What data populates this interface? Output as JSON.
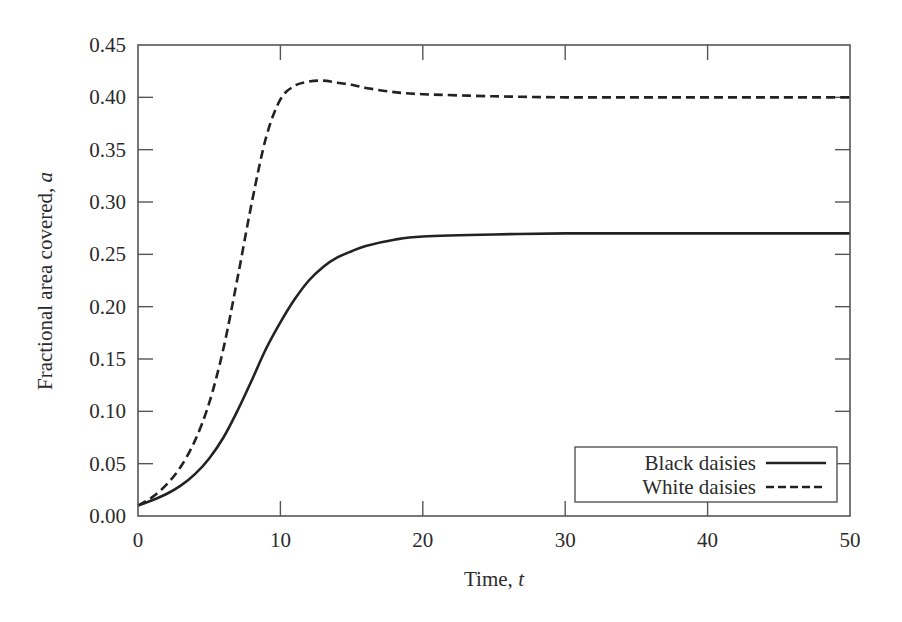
{
  "chart_data": {
    "type": "line",
    "title": "",
    "xlabel": "Time, t",
    "xlabel_main": "Time, ",
    "xlabel_var": "t",
    "ylabel": "Fractional area covered, a",
    "ylabel_main": "Fractional area covered, ",
    "ylabel_var": "a",
    "xlim": [
      0,
      50
    ],
    "ylim": [
      0,
      0.45
    ],
    "grid": false,
    "legend_position": "lower right",
    "x_ticks": [
      0,
      10,
      20,
      30,
      40,
      50
    ],
    "x_tick_labels": [
      "0",
      "10",
      "20",
      "30",
      "40",
      "50"
    ],
    "y_ticks": [
      0,
      0.05,
      0.1,
      0.15,
      0.2,
      0.25,
      0.3,
      0.35,
      0.4,
      0.45
    ],
    "y_tick_labels": [
      "0.00",
      "0.05",
      "0.10",
      "0.15",
      "0.20",
      "0.25",
      "0.30",
      "0.35",
      "0.40",
      "0.45"
    ],
    "series": [
      {
        "name": "Black daisies",
        "style": "solid",
        "color": "#222222",
        "x": [
          0,
          1,
          2,
          3,
          4,
          5,
          6,
          7,
          8,
          9,
          10,
          11,
          12,
          13,
          14,
          15,
          16,
          18,
          20,
          25,
          30,
          35,
          40,
          45,
          50
        ],
        "values": [
          0.01,
          0.015,
          0.021,
          0.029,
          0.04,
          0.055,
          0.075,
          0.101,
          0.13,
          0.16,
          0.185,
          0.207,
          0.225,
          0.238,
          0.247,
          0.253,
          0.258,
          0.264,
          0.267,
          0.269,
          0.27,
          0.27,
          0.27,
          0.27,
          0.27
        ]
      },
      {
        "name": "White daisies",
        "style": "dashed",
        "color": "#222222",
        "x": [
          0,
          1,
          2,
          3,
          4,
          5,
          6,
          7,
          8,
          9,
          10,
          11,
          12,
          13,
          14,
          15,
          16,
          18,
          20,
          25,
          30,
          35,
          40,
          45,
          50
        ],
        "values": [
          0.01,
          0.018,
          0.03,
          0.047,
          0.072,
          0.108,
          0.16,
          0.228,
          0.3,
          0.362,
          0.398,
          0.411,
          0.415,
          0.416,
          0.414,
          0.412,
          0.409,
          0.405,
          0.403,
          0.401,
          0.4,
          0.4,
          0.4,
          0.4,
          0.4
        ]
      }
    ]
  },
  "legend": {
    "items": [
      {
        "label": "Black daisies",
        "style": "solid"
      },
      {
        "label": "White daisies",
        "style": "dashed"
      }
    ]
  },
  "colors": {
    "line": "#222222",
    "axis": "#555555",
    "text": "#2b2b2b",
    "background": "#ffffff"
  }
}
